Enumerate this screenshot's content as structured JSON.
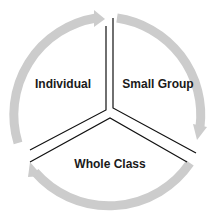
{
  "diagram": {
    "type": "cycle",
    "segments": [
      {
        "label": "Individual",
        "position": "upper-left"
      },
      {
        "label": "Small Group",
        "position": "upper-right"
      },
      {
        "label": "Whole Class",
        "position": "bottom"
      }
    ],
    "flow": "clockwise",
    "colors": {
      "arrow": "#cccccc",
      "divider": "#111111",
      "text": "#1a1a1a",
      "background": "#ffffff"
    }
  }
}
